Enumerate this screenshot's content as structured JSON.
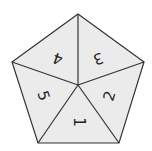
{
  "diagram": {
    "shape": "pentagon divided into 5 triangles",
    "fill_color": "#ebebeb",
    "stroke_color": "#333333",
    "sections": [
      {
        "label": "1",
        "rotation": 0
      },
      {
        "label": "2",
        "rotation": -72
      },
      {
        "label": "3",
        "rotation": 180
      },
      {
        "label": "4",
        "rotation": 180
      },
      {
        "label": "5",
        "rotation": 72
      }
    ]
  }
}
